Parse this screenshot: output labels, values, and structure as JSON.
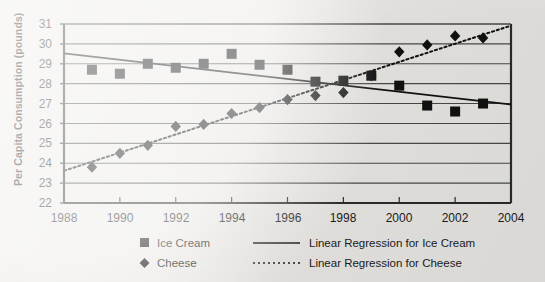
{
  "chart_data": {
    "type": "scatter",
    "title": "",
    "xlabel": "",
    "ylabel": "Per Capita Consumption (pounds)",
    "xlim": [
      1988,
      2004
    ],
    "ylim": [
      22,
      31
    ],
    "xticks": [
      1988,
      1990,
      1992,
      1994,
      1996,
      1998,
      2000,
      2002,
      2004
    ],
    "yticks": [
      22,
      23,
      24,
      25,
      26,
      27,
      28,
      29,
      30,
      31
    ],
    "grid": "horizontal",
    "legend_position": "below-axes",
    "x": [
      1989,
      1990,
      1991,
      1992,
      1993,
      1994,
      1995,
      1996,
      1997,
      1998,
      1999,
      2000,
      2001,
      2002,
      2003
    ],
    "series": [
      {
        "name": "Ice Cream",
        "marker": "square",
        "color": "#111111",
        "values": [
          28.7,
          28.5,
          29.0,
          28.8,
          29.0,
          29.5,
          28.95,
          28.7,
          28.1,
          28.15,
          28.4,
          27.9,
          26.9,
          26.6,
          27.0
        ]
      },
      {
        "name": "Cheese",
        "marker": "diamond",
        "color": "#111111",
        "values": [
          23.8,
          24.5,
          24.9,
          25.85,
          25.95,
          26.5,
          26.8,
          27.2,
          27.4,
          27.55,
          28.4,
          29.6,
          29.95,
          30.4,
          30.3
        ]
      }
    ],
    "trendlines": [
      {
        "name": "Linear Regression for Ice Cream",
        "style": "solid",
        "color": "#111111",
        "x0": 1988,
        "y0": 29.52,
        "x1": 2004,
        "y1": 26.95
      },
      {
        "name": "Linear Regression for Cheese",
        "style": "dotted",
        "color": "#111111",
        "x0": 1988,
        "y0": 23.62,
        "x1": 2004,
        "y1": 30.92
      }
    ]
  },
  "axes": {
    "y_title": "Per Capita Consumption (pounds)",
    "y_tick_labels": [
      "31",
      "30",
      "29",
      "28",
      "27",
      "26",
      "25",
      "24",
      "23",
      "22"
    ],
    "x_tick_labels": [
      "1988",
      "1990",
      "1992",
      "1994",
      "1996",
      "1998",
      "2000",
      "2002",
      "2004"
    ]
  },
  "legend": {
    "entries": [
      {
        "label": "Ice Cream",
        "marker": "square-marker-icon"
      },
      {
        "label": "Cheese",
        "marker": "diamond-marker-icon"
      }
    ],
    "trend_entries": [
      {
        "label": "Linear Regression for Ice Cream",
        "line": "solid-line-icon"
      },
      {
        "label": "Linear Regression for Cheese",
        "line": "dotted-line-icon"
      }
    ]
  },
  "colors": {
    "background": "#eceae6",
    "ink": "#1b1b1b",
    "marker": "#111111",
    "grid": "#4a4a4a"
  }
}
